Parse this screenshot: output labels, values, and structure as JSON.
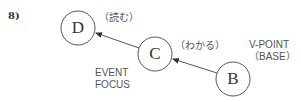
{
  "figure": {
    "number": "8)",
    "nodes": [
      {
        "id": "D",
        "letter": "D",
        "annotation": "（読む）"
      },
      {
        "id": "C",
        "letter": "C",
        "annotation": "（わかる）"
      },
      {
        "id": "B",
        "letter": "B",
        "annotation": ""
      }
    ],
    "edges": [
      {
        "from": "B",
        "to": "C"
      },
      {
        "from": "C",
        "to": "D"
      }
    ],
    "labels": {
      "event_focus_line1": "EVENT",
      "event_focus_line2": "FOCUS",
      "vpoint_line1": "V-POINT",
      "vpoint_line2": "（BASE）"
    },
    "colors": {
      "stroke": "#555555",
      "text": "#444444"
    }
  }
}
